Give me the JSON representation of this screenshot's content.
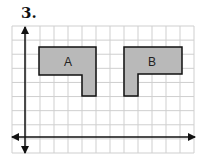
{
  "problem": {
    "number": "3."
  },
  "grid": {
    "columns": 13,
    "rows": 9,
    "line_color": "#cfcfcf"
  },
  "axes": {
    "color": "#111111"
  },
  "shapes": [
    {
      "label": "A",
      "fill": "#b9b9b9",
      "stroke": "#111111"
    },
    {
      "label": "B",
      "fill": "#b9b9b9",
      "stroke": "#111111"
    }
  ]
}
